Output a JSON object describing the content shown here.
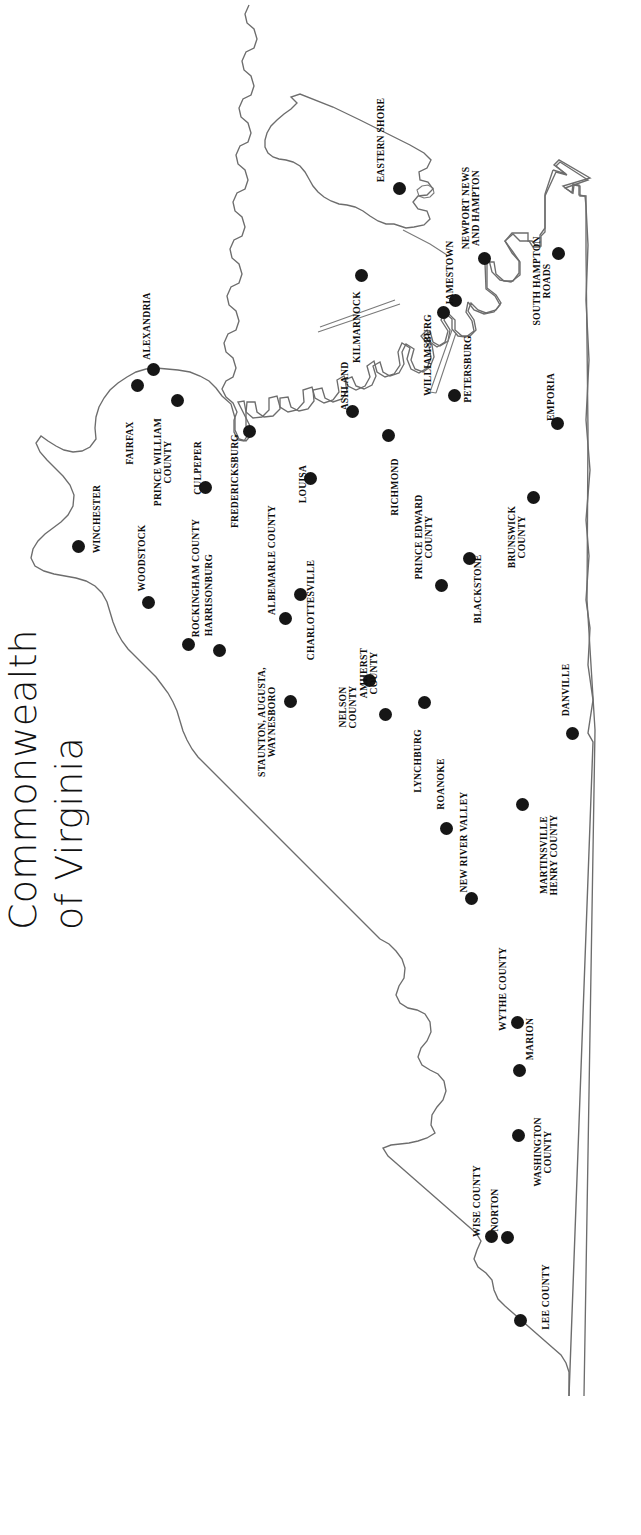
{
  "document": {
    "kind": "map",
    "title_lines": [
      "Commonwealth",
      "of Virginia"
    ],
    "title_full": "Commonwealth of Virginia",
    "background_color": "#ffffff",
    "outline_color": "#6d6d6d",
    "marker_color": "#161616",
    "label_color": "#0d0d0d",
    "orientation_note": "map rendered rotated 90 degrees counter-clockwise; north points to the left of the page"
  },
  "map": {
    "name": "Commonwealth of Virginia",
    "marker_count": 36,
    "markers": [
      {
        "label": "EASTERN SHORE",
        "x": 399,
        "y": 188,
        "lx": 381,
        "ly": 140,
        "anchor": "rot"
      },
      {
        "label": "KILMARNOCK",
        "x": 361,
        "y": 275,
        "lx": 357,
        "ly": 327,
        "anchor": "rot"
      },
      {
        "label": "NEWPORT NEWS\nAND HAMPTON",
        "x": 484,
        "y": 258,
        "lx": 471,
        "ly": 208,
        "anchor": "rot"
      },
      {
        "label": "JAMESTOWN",
        "x": 455,
        "y": 300,
        "lx": 450,
        "ly": 273,
        "anchor": "rot"
      },
      {
        "label": "WILLIAMSBURG",
        "x": 443,
        "y": 312,
        "lx": 428,
        "ly": 355,
        "anchor": "rot"
      },
      {
        "label": "PETERSBURG",
        "x": 454,
        "y": 395,
        "lx": 468,
        "ly": 369,
        "anchor": "rot"
      },
      {
        "label": "SOUTH HAMPTON\nROADS",
        "x": 558,
        "y": 253,
        "lx": 542,
        "ly": 281,
        "anchor": "rot"
      },
      {
        "label": "EMPORIA",
        "x": 557,
        "y": 423,
        "lx": 551,
        "ly": 397,
        "anchor": "rot"
      },
      {
        "label": "ASHLAND",
        "x": 352,
        "y": 411,
        "lx": 345,
        "ly": 386,
        "anchor": "rot"
      },
      {
        "label": "RICHMOND",
        "x": 388,
        "y": 435,
        "lx": 395,
        "ly": 487,
        "anchor": "rot"
      },
      {
        "label": "LOUISA",
        "x": 310,
        "y": 478,
        "lx": 303,
        "ly": 484,
        "anchor": "rot"
      },
      {
        "label": "FREDERICKSBURG",
        "x": 249,
        "y": 431,
        "lx": 235,
        "ly": 481,
        "anchor": "rot"
      },
      {
        "label": "ALEXANDRIA",
        "x": 153,
        "y": 369,
        "lx": 147,
        "ly": 326,
        "anchor": "rot"
      },
      {
        "label": "FAIRFAX",
        "x": 137,
        "y": 385,
        "lx": 130,
        "ly": 443,
        "anchor": "rot"
      },
      {
        "label": "PRINCE WILLIAM\nCOUNTY",
        "x": 177,
        "y": 400,
        "lx": 163,
        "ly": 462,
        "anchor": "rot"
      },
      {
        "label": "CULPEPER",
        "x": 205,
        "y": 487,
        "lx": 198,
        "ly": 468,
        "anchor": "rot"
      },
      {
        "label": "WINCHESTER",
        "x": 78,
        "y": 546,
        "lx": 97,
        "ly": 519,
        "anchor": "rot"
      },
      {
        "label": "WOODSTOCK",
        "x": 148,
        "y": 602,
        "lx": 142,
        "ly": 558,
        "anchor": "rot"
      },
      {
        "label": "ROCKINGHAM COUNTY",
        "x": 188,
        "y": 644,
        "lx": 196,
        "ly": 578,
        "anchor": "rot"
      },
      {
        "label": "HARRISONBURG",
        "x": 219,
        "y": 650,
        "lx": 209,
        "ly": 595,
        "anchor": "rot"
      },
      {
        "label": "ALBEMARLE COUNTY",
        "x": 285,
        "y": 618,
        "lx": 272,
        "ly": 560,
        "anchor": "rot"
      },
      {
        "label": "CHARLOTTESVILLE",
        "x": 300,
        "y": 594,
        "lx": 311,
        "ly": 610,
        "anchor": "rot"
      },
      {
        "label": "STAUNTON, AUGUSTA,\nWAYNESBORO",
        "x": 290,
        "y": 701,
        "lx": 267,
        "ly": 722,
        "anchor": "rot"
      },
      {
        "label": "NELSON\nCOUNTY",
        "x": 369,
        "y": 680,
        "lx": 348,
        "ly": 707,
        "anchor": "rot"
      },
      {
        "label": "AMHERST\nCOUNTY",
        "x": 385,
        "y": 714,
        "lx": 369,
        "ly": 673,
        "anchor": "rot"
      },
      {
        "label": "LYNCHBURG",
        "x": 424,
        "y": 702,
        "lx": 418,
        "ly": 761,
        "anchor": "rot"
      },
      {
        "label": "ROANOKE",
        "x": 446,
        "y": 828,
        "lx": 441,
        "ly": 784,
        "anchor": "rot"
      },
      {
        "label": "NEW RIVER VALLEY",
        "x": 471,
        "y": 898,
        "lx": 464,
        "ly": 842,
        "anchor": "rot"
      },
      {
        "label": "PRINCE EDWARD\nCOUNTY",
        "x": 441,
        "y": 585,
        "lx": 424,
        "ly": 537,
        "anchor": "rot"
      },
      {
        "label": "BLACKSTONE",
        "x": 469,
        "y": 558,
        "lx": 478,
        "ly": 589,
        "anchor": "rot"
      },
      {
        "label": "BRUNSWICK\nCOUNTY",
        "x": 533,
        "y": 497,
        "lx": 517,
        "ly": 537,
        "anchor": "rot"
      },
      {
        "label": "MARTINSVILLE\nHENRY COUNTY",
        "x": 522,
        "y": 804,
        "lx": 549,
        "ly": 855,
        "anchor": "rot"
      },
      {
        "label": "DANVILLE",
        "x": 572,
        "y": 733,
        "lx": 566,
        "ly": 690,
        "anchor": "rot"
      },
      {
        "label": "WYTHE COUNTY",
        "x": 517,
        "y": 1022,
        "lx": 503,
        "ly": 989,
        "anchor": "rot"
      },
      {
        "label": "MARION",
        "x": 519,
        "y": 1070,
        "lx": 530,
        "ly": 1039,
        "anchor": "rot"
      },
      {
        "label": "WASHINGTON\nCOUNTY",
        "x": 518,
        "y": 1135,
        "lx": 543,
        "ly": 1152,
        "anchor": "rot"
      },
      {
        "label": "WISE COUNTY",
        "x": 491,
        "y": 1236,
        "lx": 477,
        "ly": 1201,
        "anchor": "rot"
      },
      {
        "label": "NORTON",
        "x": 507,
        "y": 1237,
        "lx": 495,
        "ly": 1210,
        "anchor": "rot"
      },
      {
        "label": "LEE COUNTY",
        "x": 520,
        "y": 1320,
        "lx": 546,
        "ly": 1297,
        "anchor": "rot"
      }
    ],
    "outline_paths": {
      "mainland": "M 586,190 L 586,186 L 581,186 L 581,181 L 576,180 L 575,186 L 570,187 L 560,182 L 549,177 L 540,172 L 528,167 L 516,162 L 506,157 L 498,153 L 490,149 L 483,145 L 476,142 L 470,139 L 465,137 L 461,135 L 458,137 L 459,143 L 462,150 L 467,158 L 472,166 L 477,173 L 481,179 L 484,184 L 486,188 L 487,191 L 486,194 L 482,196 L 477,197 L 471,198 L 466,199 L 462,200 L 459,203 L 458,208 L 459,214 L 461,220 L 463,226 L 464,232 L 463,238 L 460,243 L 456,247 L 451,251 L 446,255 L 442,259 L 439,264 L 438,270 L 439,277 L 442,284 L 446,291 L 450,297 L 453,303 L 455,309 L 455,315 L 453,320 L 449,324 L 444,327 L 438,330 L 433,333 L 429,337 L 427,342 L 427,348 L 429,355 L 432,362 L 435,369 L 437,376 L 438,383 L 437,389 L 435,394 L 431,398 L 427,402 L 422,406 L 418,410 L 415,415 L 414,421 L 415,428 L 417,435 L 419,442 L 420,449 L 419,455 L 417,460 L 414,464 L 410,468 L 406,472 L 403,477 L 402,483 L 403,490 L 405,497 L 407,504 L 408,511 L 407,517 L 405,522 L 402,526 L 398,530 L 394,534 L 391,539 L 390,545 L 391,552 L 393,559 L 395,566 L 396,573 L 395,579 L 393,584 L 390,588 L 386,592 L 383,596 L 380,601 L 379,607 L 380,614 L 382,621 L 384,628 L 385,635 L 384,641 L 382,646 L 379,650 L 375,654 L 372,658 L 369,663 L 368,669 L 369,676 L 371,683 L 373,690 L 374,697 L 373,703 L 371,708 L 368,712 L 364,716 L 361,720 L 358,725 L 357,731 L 358,738 L 360,745 L 362,752 L 363,759 L 362,765 L 360,770 L 357,774 L 353,778 L 350,782 L 347,787 L 346,793 L 347,800 L 349,807 L 351,814 L 352,821 L 351,827 L 349,832 L 346,836 L 342,840 L 339,844 L 336,849 L 335,855 L 336,862 L 338,869 L 340,876 L 341,883 L 340,889 L 338,894 L 335,898 L 331,902 L 328,906 L 325,911 L 324,917 L 325,924 L 327,931 L 329,938 L 330,945 L 329,951 L 327,956 L 324,960 L 320,964 L 317,968 L 314,973 L 313,979 L 314,986 L 316,993 L 318,1000 L 319,1007 L 318,1013 L 316,1018 L 313,1022 L 309,1026 L 306,1030 L 303,1035 L 302,1041 L 303,1048 L 305,1055 L 307,1062 L 308,1069 L 307,1075 L 305,1080 L 302,1084 L 298,1088 L 295,1092 L 292,1097 L 291,1103 L 292,1110 L 294,1117",
      "note": "simplified outline; actual rendered geometry is drawn in the inline SVG"
    }
  }
}
